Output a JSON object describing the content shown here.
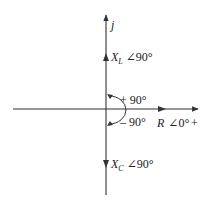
{
  "diagram": {
    "type": "phasor-diagram",
    "colors": {
      "line": "#333333",
      "text": "#222222",
      "background": "#ffffff"
    },
    "axes": {
      "vertical_label": "j",
      "horizontal_positive_label": "+"
    },
    "phasors": {
      "inductive": {
        "symbol": "X",
        "subscript": "L",
        "angle": "∠90°"
      },
      "resistive": {
        "symbol": "R",
        "angle": "∠0°"
      },
      "capacitive": {
        "symbol": "X",
        "subscript": "C",
        "angle": "∠90°"
      }
    },
    "rotation": {
      "positive": "+ 90°",
      "negative": "– 90°"
    }
  }
}
